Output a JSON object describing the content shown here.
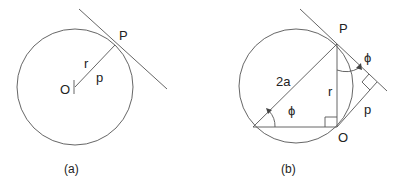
{
  "figures": [
    {
      "id": "a",
      "caption": "(a)",
      "labels": {
        "P": "P",
        "O": "O",
        "r": "r",
        "p": "p"
      }
    },
    {
      "id": "b",
      "caption": "(b)",
      "labels": {
        "P": "P",
        "O": "O",
        "hyp": "2a",
        "r": "r",
        "phi_lower": "ϕ",
        "phi_upper": "ϕ",
        "p": "p"
      }
    }
  ],
  "colors": {
    "line": "#555555",
    "text": "#222222",
    "background": "#ffffff"
  }
}
